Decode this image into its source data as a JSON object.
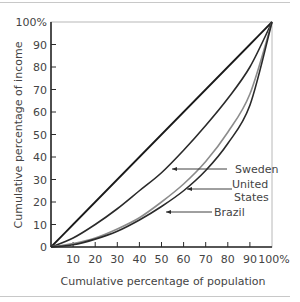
{
  "chart_data": {
    "type": "line",
    "title": "",
    "xlabel": "Cumulative percentage of population",
    "ylabel": "Cumulative percentage of income",
    "xlim": [
      0,
      100
    ],
    "ylim": [
      0,
      100
    ],
    "x_ticks": [
      "10",
      "20",
      "30",
      "40",
      "50",
      "60",
      "70",
      "80",
      "90",
      "100%"
    ],
    "y_ticks": [
      "0",
      "10",
      "20",
      "30",
      "40",
      "50",
      "60",
      "70",
      "80",
      "90",
      "100%"
    ],
    "grid": false,
    "legend": "inline annotations with arrows",
    "x": [
      0,
      10,
      20,
      30,
      40,
      50,
      60,
      70,
      80,
      90,
      100
    ],
    "series": [
      {
        "name": "Line of equality",
        "color": "#1a1a1a",
        "values": [
          0,
          10,
          20,
          30,
          40,
          50,
          60,
          70,
          80,
          90,
          100
        ]
      },
      {
        "name": "Sweden",
        "color": "#2a2a2a",
        "values": [
          0,
          4,
          10,
          17,
          25,
          33,
          43,
          54,
          66,
          80,
          100
        ]
      },
      {
        "name": "United States",
        "color": "#8c8c8c",
        "values": [
          0,
          1.5,
          4,
          8,
          13,
          20,
          28,
          38,
          51,
          68,
          100
        ]
      },
      {
        "name": "Brazil",
        "color": "#2a2a2a",
        "values": [
          0,
          1,
          3.5,
          7,
          12,
          18,
          25,
          34,
          46,
          63,
          100
        ]
      }
    ],
    "annotations": [
      {
        "text": "Sweden",
        "points_to": "Sweden"
      },
      {
        "text": "United States",
        "points_to": "United States"
      },
      {
        "text": "Brazil",
        "points_to": "Brazil"
      }
    ]
  },
  "labels": {
    "ylabel": "Cumulative percentage of income",
    "xlabel": "Cumulative percentage of population",
    "sweden": "Sweden",
    "us_line1": "United",
    "us_line2": "States",
    "brazil": "Brazil"
  },
  "ticks": {
    "y": [
      "0",
      "10",
      "20",
      "30",
      "40",
      "50",
      "60",
      "70",
      "80",
      "90",
      "100%"
    ],
    "x": [
      "10",
      "20",
      "30",
      "40",
      "50",
      "60",
      "70",
      "80",
      "90",
      "100%"
    ]
  }
}
